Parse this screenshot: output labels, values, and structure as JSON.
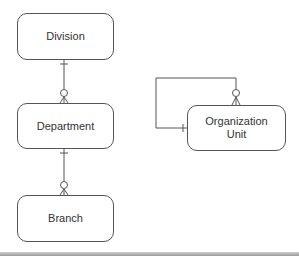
{
  "diagram": {
    "type": "entity-relationship",
    "notation": "crow's foot",
    "entities": [
      {
        "id": "division",
        "label": "Division"
      },
      {
        "id": "department",
        "label": "Department"
      },
      {
        "id": "branch",
        "label": "Branch"
      },
      {
        "id": "org_unit",
        "label": "Organization\nUnit",
        "label_line1": "Organization",
        "label_line2": "Unit"
      }
    ],
    "relationships": [
      {
        "from": "division",
        "to": "department",
        "from_cardinality": "one",
        "to_cardinality": "zero-or-many"
      },
      {
        "from": "department",
        "to": "branch",
        "from_cardinality": "one",
        "to_cardinality": "zero-or-many"
      },
      {
        "from": "org_unit",
        "to": "org_unit",
        "from_cardinality": "one",
        "to_cardinality": "zero-or-many",
        "recursive": true
      }
    ],
    "colors": {
      "line": "#555555",
      "text": "#333333",
      "background": "#ffffff"
    }
  }
}
